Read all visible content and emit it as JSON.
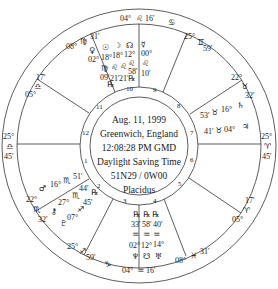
{
  "chart_info": {
    "date": "Aug. 11, 1999",
    "location": "Greenwich, England",
    "time": "12:08:28 PM GMD",
    "dst": "Daylight Saving Time",
    "coords": "51N29 / 0W00",
    "house_system": "Placidus"
  },
  "house_numbers": [
    "1",
    "2",
    "3",
    "4",
    "5",
    "6",
    "7",
    "8",
    "9",
    "10",
    "11",
    "12"
  ],
  "cusps": {
    "c10": {
      "deg": "04°",
      "sign": "♌",
      "min": "16'"
    },
    "c11": {
      "deg": "08°",
      "sign": "♍",
      "min": "31'"
    },
    "c12": {
      "deg": "05°",
      "sign": "♎",
      "min": "17'"
    },
    "c1": {
      "deg": "25°",
      "sign": "♎",
      "min": "45'"
    },
    "c2": {
      "deg": "22°",
      "sign": "♏",
      "min": "32'"
    },
    "c3": {
      "deg": "25°",
      "sign": "♐",
      "min": "59'"
    },
    "c4": {
      "deg": "04°",
      "sign": "♒",
      "min": "16'"
    },
    "c5": {
      "deg": "08°",
      "sign": "♓",
      "min": "31'"
    },
    "c6": {
      "deg": "05°",
      "sign": "♈",
      "min": "17'"
    },
    "c7": {
      "deg": "25°",
      "sign": "♈",
      "min": "45'"
    },
    "c8": {
      "deg": "22°",
      "sign": "♉",
      "min": "32'"
    },
    "c9": {
      "deg": "25°",
      "sign": "♊",
      "min": "59'"
    }
  },
  "outer_glyphs": {
    "top_between_10_9": "♋",
    "bottom_between_3_4": "♑"
  },
  "planets": {
    "venus": {
      "glyph": "♀",
      "deg": "02°",
      "sign": "♍",
      "min": "09'",
      "retro": "℞"
    },
    "sun": {
      "glyph": "☉",
      "deg": "18°",
      "sign": "♌",
      "min": "21'"
    },
    "moon": {
      "glyph": "☽",
      "deg": "18°",
      "sign": "♌",
      "min": "21'",
      "retro": "℞"
    },
    "node": {
      "glyph": "☊",
      "deg": "12°",
      "sign": "♌",
      "min": "58'"
    },
    "mercury": {
      "glyph": "☿",
      "deg": "00°",
      "sign": "♌",
      "min": "10'"
    },
    "saturn": {
      "glyph": "♄",
      "deg": "16°",
      "sign": "♉",
      "min": "53'"
    },
    "jupiter": {
      "glyph": "♃",
      "deg": "04°",
      "sign": "♉",
      "min": "41'"
    },
    "mars": {
      "glyph": "♂",
      "deg": "16°",
      "sign": "♏",
      "min": "51'"
    },
    "chiron": {
      "glyph": "⚷",
      "deg": "27°",
      "sign": "♏",
      "min": "44'",
      "retro": "℞"
    },
    "pluto": {
      "glyph": "♇",
      "deg": "07°",
      "sign": "♐",
      "min": "45'",
      "retro": "℞"
    },
    "neptune": {
      "glyph": "♆",
      "deg": "02°",
      "sign": "♒",
      "min": "33'",
      "retro": "℞"
    },
    "southnode": {
      "glyph": "☋",
      "deg": "12°",
      "sign": "♒",
      "min": "58'",
      "retro": "℞"
    },
    "uranus": {
      "glyph": "♅",
      "deg": "14°",
      "sign": "♒",
      "min": "40'",
      "retro": "℞"
    }
  }
}
